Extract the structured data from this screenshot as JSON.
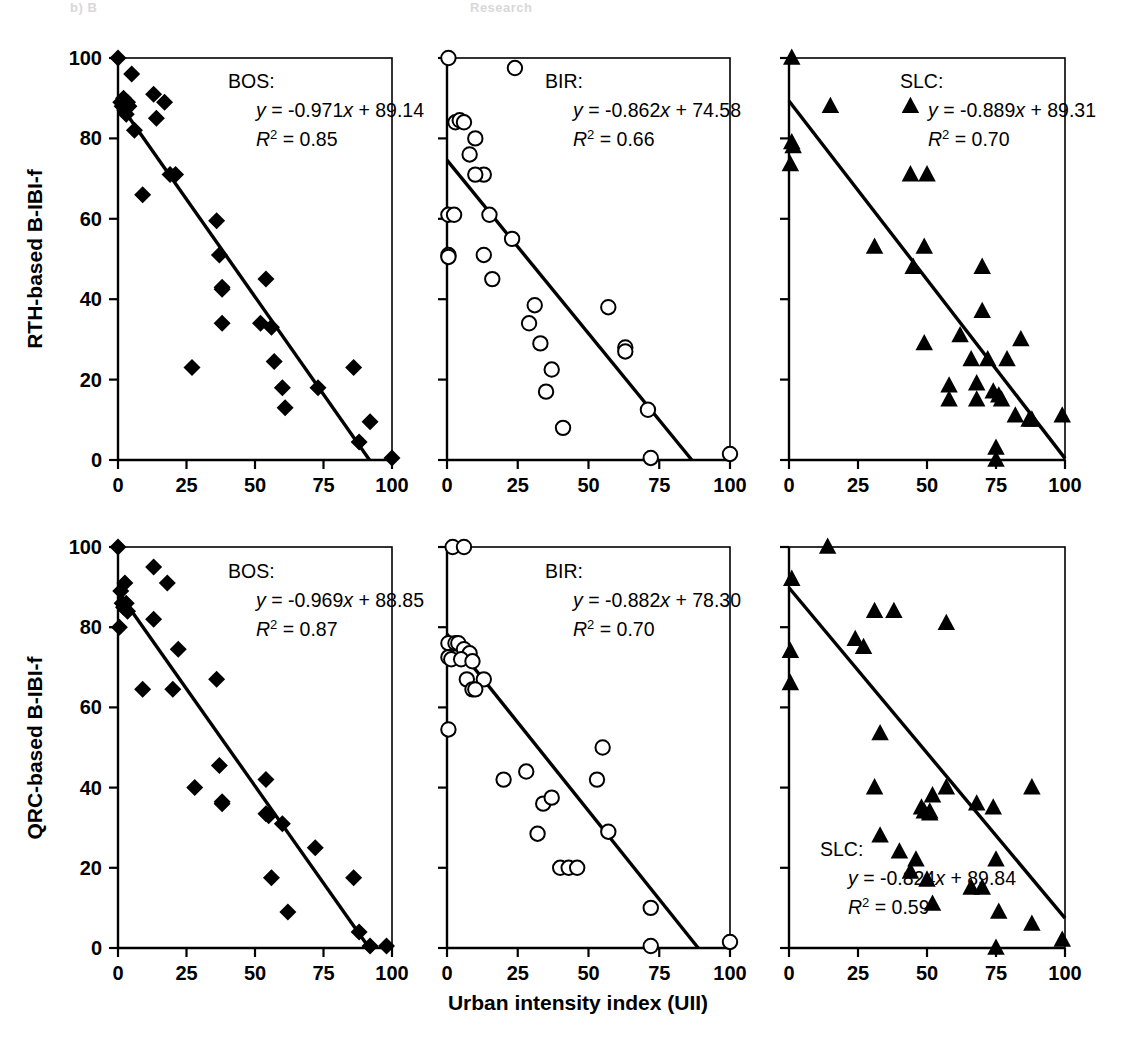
{
  "figure": {
    "width": 1138,
    "height": 1060,
    "background": "#ffffff",
    "ghost_header_left": "b) B",
    "ghost_header_right": "Research"
  },
  "axes": {
    "x_title": "Urban intensity index (UII)",
    "x_ticks": [
      0,
      25,
      50,
      75,
      100
    ],
    "x_tick_labels": [
      "0",
      "25",
      "50",
      "75",
      "100"
    ],
    "x_min": 0,
    "x_max": 100,
    "y_ticks": [
      0,
      20,
      40,
      60,
      80,
      100
    ],
    "y_tick_labels": [
      "0",
      "20",
      "40",
      "60",
      "80",
      "100"
    ],
    "y_min": 0,
    "y_max": 100,
    "y_title_top": "RTH-based B-IBI-f",
    "y_title_bottom": "QRC-based B-IBI-f"
  },
  "chart_data": [
    {
      "type": "scatter",
      "panel": "top-left",
      "title": "",
      "site": "BOS:",
      "equation": "y = -0.971x + 89.14",
      "r_squared_label": "R",
      "r_squared_exp": "2",
      "r_squared_value": "= 0.85",
      "slope": -0.971,
      "intercept": 89.14,
      "r2": 0.85,
      "marker": "filled-diamond",
      "marker_color": "#000000",
      "xlabel": "Urban intensity index (UII)",
      "ylabel": "RTH-based B-IBI-f",
      "xlim": [
        0,
        100
      ],
      "ylim": [
        0,
        100
      ],
      "grid": false,
      "points": [
        [
          0,
          100
        ],
        [
          1,
          89
        ],
        [
          1.5,
          88
        ],
        [
          2,
          90
        ],
        [
          2.5,
          87
        ],
        [
          3,
          86
        ],
        [
          3.5,
          89
        ],
        [
          4,
          88
        ],
        [
          5,
          96
        ],
        [
          6,
          82
        ],
        [
          9,
          66
        ],
        [
          13,
          91
        ],
        [
          14,
          85
        ],
        [
          17,
          89
        ],
        [
          19,
          71
        ],
        [
          21,
          71
        ],
        [
          27,
          23
        ],
        [
          36,
          59.5
        ],
        [
          37,
          51
        ],
        [
          38,
          43
        ],
        [
          38,
          42.5
        ],
        [
          38,
          34
        ],
        [
          52,
          34
        ],
        [
          54,
          45
        ],
        [
          56,
          33
        ],
        [
          57,
          24.5
        ],
        [
          60,
          18
        ],
        [
          61,
          13
        ],
        [
          73,
          18
        ],
        [
          86,
          23
        ],
        [
          88,
          4.5
        ],
        [
          92,
          9.5
        ],
        [
          100,
          0.5
        ]
      ]
    },
    {
      "type": "scatter",
      "panel": "top-middle",
      "title": "",
      "site": "BIR:",
      "equation": "y = -0.862x + 74.58",
      "r_squared_label": "R",
      "r_squared_exp": "2",
      "r_squared_value": "= 0.66",
      "slope": -0.862,
      "intercept": 74.58,
      "r2": 0.66,
      "marker": "open-circle",
      "marker_color": "#000000",
      "xlabel": "Urban intensity index (UII)",
      "ylabel": "RTH-based B-IBI-f",
      "xlim": [
        0,
        100
      ],
      "ylim": [
        0,
        100
      ],
      "grid": false,
      "points": [
        [
          0.5,
          100
        ],
        [
          24,
          97.5
        ],
        [
          3,
          84
        ],
        [
          4.5,
          84.5
        ],
        [
          6,
          84
        ],
        [
          10,
          80
        ],
        [
          8,
          76
        ],
        [
          13,
          71
        ],
        [
          10,
          71
        ],
        [
          0.5,
          61
        ],
        [
          2.5,
          61
        ],
        [
          15,
          61
        ],
        [
          0.5,
          51
        ],
        [
          0.5,
          50.5
        ],
        [
          13,
          51
        ],
        [
          16,
          45
        ],
        [
          23,
          55
        ],
        [
          31,
          38.5
        ],
        [
          29,
          34
        ],
        [
          33,
          29
        ],
        [
          37,
          22.5
        ],
        [
          35,
          17
        ],
        [
          41,
          8
        ],
        [
          57,
          38
        ],
        [
          63,
          28
        ],
        [
          63,
          27
        ],
        [
          71,
          12.5
        ],
        [
          72,
          0.5
        ],
        [
          100,
          1.5
        ]
      ]
    },
    {
      "type": "scatter",
      "panel": "top-right",
      "title": "",
      "site": "SLC:",
      "equation": "y = -0.889x + 89.31",
      "r_squared_label": "R",
      "r_squared_exp": "2",
      "r_squared_value": "= 0.70",
      "slope": -0.889,
      "intercept": 89.31,
      "r2": 0.7,
      "marker": "filled-triangle",
      "marker_color": "#000000",
      "xlabel": "Urban intensity index (UII)",
      "ylabel": "RTH-based B-IBI-f",
      "xlim": [
        0,
        100
      ],
      "ylim": [
        0,
        100
      ],
      "grid": false,
      "points": [
        [
          1,
          100
        ],
        [
          1,
          79
        ],
        [
          1.5,
          78
        ],
        [
          0.5,
          73.5
        ],
        [
          15,
          88
        ],
        [
          44,
          88
        ],
        [
          31,
          53
        ],
        [
          49,
          53
        ],
        [
          44,
          71
        ],
        [
          50,
          71
        ],
        [
          45,
          48
        ],
        [
          70,
          48
        ],
        [
          70,
          37
        ],
        [
          49,
          29
        ],
        [
          62,
          31
        ],
        [
          84,
          30
        ],
        [
          66,
          25
        ],
        [
          72,
          25
        ],
        [
          79,
          25
        ],
        [
          58,
          18.5
        ],
        [
          58,
          15
        ],
        [
          68,
          19
        ],
        [
          68,
          15
        ],
        [
          74,
          17
        ],
        [
          76,
          16
        ],
        [
          77,
          15
        ],
        [
          82,
          11
        ],
        [
          87,
          10
        ],
        [
          88,
          10
        ],
        [
          99,
          11
        ],
        [
          75,
          3
        ],
        [
          75,
          0
        ]
      ]
    },
    {
      "type": "scatter",
      "panel": "bottom-left",
      "title": "",
      "site": "BOS:",
      "equation": "y = -0.969x + 88.85",
      "r_squared_label": "R",
      "r_squared_exp": "2",
      "r_squared_value": "= 0.87",
      "slope": -0.969,
      "intercept": 88.85,
      "r2": 0.87,
      "marker": "filled-diamond",
      "marker_color": "#000000",
      "xlabel": "Urban intensity index (UII)",
      "ylabel": "QRC-based B-IBI-f",
      "xlim": [
        0,
        100
      ],
      "ylim": [
        0,
        100
      ],
      "grid": false,
      "points": [
        [
          0,
          100
        ],
        [
          1,
          89
        ],
        [
          2.5,
          91
        ],
        [
          1.5,
          86
        ],
        [
          2,
          85
        ],
        [
          3,
          86
        ],
        [
          3.5,
          84
        ],
        [
          0.5,
          80
        ],
        [
          13,
          95
        ],
        [
          18,
          91
        ],
        [
          13,
          82
        ],
        [
          9,
          64.5
        ],
        [
          20,
          64.5
        ],
        [
          22,
          74.5
        ],
        [
          28,
          40
        ],
        [
          36,
          67
        ],
        [
          37,
          45.5
        ],
        [
          38,
          36
        ],
        [
          38,
          36.5
        ],
        [
          54,
          42
        ],
        [
          55,
          33
        ],
        [
          54,
          33.5
        ],
        [
          60,
          31
        ],
        [
          56,
          17.5
        ],
        [
          62,
          9
        ],
        [
          72,
          25
        ],
        [
          86,
          17.5
        ],
        [
          88,
          4
        ],
        [
          92,
          0.5
        ],
        [
          98,
          0.5
        ]
      ]
    },
    {
      "type": "scatter",
      "panel": "bottom-middle",
      "title": "",
      "site": "BIR:",
      "equation": "y = -0.882x + 78.30",
      "r_squared_label": "R",
      "r_squared_exp": "2",
      "r_squared_value": "= 0.70",
      "slope": -0.882,
      "intercept": 78.3,
      "r2": 0.7,
      "marker": "open-circle",
      "marker_color": "#000000",
      "xlabel": "Urban intensity index (UII)",
      "ylabel": "QRC-based B-IBI-f",
      "xlim": [
        0,
        100
      ],
      "ylim": [
        0,
        100
      ],
      "grid": false,
      "points": [
        [
          2,
          100
        ],
        [
          6,
          100
        ],
        [
          0.5,
          76
        ],
        [
          3,
          76
        ],
        [
          4,
          76
        ],
        [
          6,
          74.5
        ],
        [
          8,
          73.5
        ],
        [
          0.5,
          72.5
        ],
        [
          1.5,
          72
        ],
        [
          5,
          72
        ],
        [
          9,
          71.5
        ],
        [
          7,
          67
        ],
        [
          13,
          67
        ],
        [
          9,
          64.5
        ],
        [
          10,
          64.5
        ],
        [
          0.5,
          54.5
        ],
        [
          20,
          42
        ],
        [
          28,
          44
        ],
        [
          34,
          36
        ],
        [
          37,
          37.5
        ],
        [
          32,
          28.5
        ],
        [
          40,
          20
        ],
        [
          43,
          20
        ],
        [
          46,
          20
        ],
        [
          55,
          50
        ],
        [
          53,
          42
        ],
        [
          57,
          29
        ],
        [
          72,
          10
        ],
        [
          72,
          0.5
        ],
        [
          100,
          1.5
        ]
      ]
    },
    {
      "type": "scatter",
      "panel": "bottom-right",
      "title": "",
      "site": "SLC:",
      "equation": "y = -0.824x + 89.84",
      "r_squared_label": "R",
      "r_squared_exp": "2",
      "r_squared_value": "= 0.59",
      "slope": -0.824,
      "intercept": 89.84,
      "r2": 0.59,
      "marker": "filled-triangle",
      "marker_color": "#000000",
      "xlabel": "Urban intensity index (UII)",
      "ylabel": "QRC-based B-IBI-f",
      "xlim": [
        0,
        100
      ],
      "ylim": [
        0,
        100
      ],
      "grid": false,
      "points": [
        [
          14,
          100
        ],
        [
          1,
          92
        ],
        [
          0.5,
          74
        ],
        [
          0.5,
          66
        ],
        [
          31,
          84
        ],
        [
          38,
          84
        ],
        [
          57,
          81
        ],
        [
          24,
          77
        ],
        [
          27,
          75
        ],
        [
          33,
          53.5
        ],
        [
          31,
          40
        ],
        [
          52,
          38
        ],
        [
          57,
          40
        ],
        [
          88,
          40
        ],
        [
          48,
          35
        ],
        [
          51,
          34
        ],
        [
          68,
          36
        ],
        [
          74,
          35
        ],
        [
          49,
          34
        ],
        [
          51,
          33.5
        ],
        [
          33,
          28
        ],
        [
          40,
          24
        ],
        [
          46,
          22
        ],
        [
          44,
          19
        ],
        [
          50,
          17
        ],
        [
          66,
          15
        ],
        [
          70,
          15
        ],
        [
          75,
          22
        ],
        [
          52,
          11
        ],
        [
          76,
          9
        ],
        [
          88,
          6
        ],
        [
          75,
          0
        ],
        [
          99,
          2
        ]
      ]
    }
  ]
}
